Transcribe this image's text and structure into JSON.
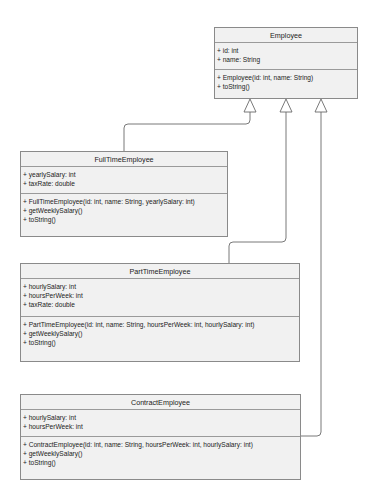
{
  "diagram": {
    "type": "UML class diagram",
    "colors": {
      "box_fill": "#f1f1f1",
      "border": "#8a8a8a",
      "line": "#6a6a6a"
    },
    "classes": [
      {
        "name": "Employee",
        "attributes": [
          "+ id: int",
          "+ name: String"
        ],
        "methods": [
          "+ Employee(id: int, name: String)",
          "+ toString()"
        ]
      },
      {
        "name": "FullTimeEmployee",
        "attributes": [
          "+ yearlySalary: int",
          "+ taxRate: double"
        ],
        "methods": [
          "+ FullTimeEmployee(id: int, name: String, yearlySalary: int)",
          "+ getWeeklySalary()",
          "+ toString()"
        ]
      },
      {
        "name": "PartTimeEmployee",
        "attributes": [
          "+ hourlySalary: int",
          "+ hoursPerWeek: int",
          "+ taxRate: double"
        ],
        "methods": [
          "+ PartTimeEmployee(id: int, name: String, hoursPerWeek: int, hourlySalary: int)",
          "+ getWeeklySalary()",
          "+ toString()"
        ]
      },
      {
        "name": "ContractEmployee",
        "attributes": [
          "+ hourlySalary: int",
          "+ hoursPerWeek: int"
        ],
        "methods": [
          "+ ContractEmployee(id: int, name: String, hoursPerWeek: int, hourlySalary: int)",
          "+ getWeeklySalary()",
          "+ toString()"
        ]
      }
    ],
    "relationships": [
      {
        "type": "inheritance",
        "from": "FullTimeEmployee",
        "to": "Employee"
      },
      {
        "type": "inheritance",
        "from": "PartTimeEmployee",
        "to": "Employee"
      },
      {
        "type": "inheritance",
        "from": "ContractEmployee",
        "to": "Employee"
      }
    ]
  }
}
